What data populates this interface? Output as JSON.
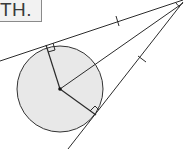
{
  "label": {
    "text": "GTH."
  },
  "diagram": {
    "circle": {
      "cx": 60,
      "cy": 89,
      "r": 43,
      "fill": "#e8e8e8",
      "stroke": "#333333"
    },
    "external_point": {
      "x": 183,
      "y": 0
    },
    "tangent_points": [
      {
        "x": 45,
        "y": 46
      },
      {
        "x": 96,
        "y": 115
      }
    ],
    "center_point": {
      "x": 60,
      "y": 89
    },
    "tick_marks": [
      {
        "x": 118,
        "y": 21
      },
      {
        "x": 142,
        "y": 59
      }
    ],
    "right_angle_markers": 2,
    "line_color": "#2b2b2b"
  }
}
